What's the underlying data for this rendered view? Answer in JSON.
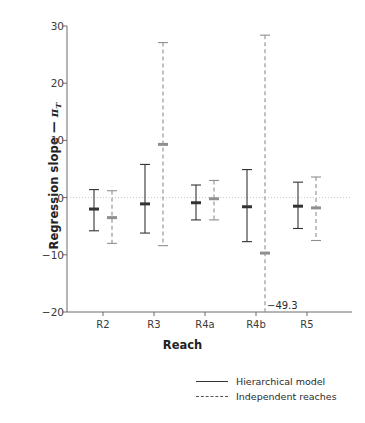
{
  "chart_data": {
    "type": "scatter",
    "title": "",
    "xlabel": "Reach",
    "ylabel_parts": {
      "prefix": "Regression slope",
      "dash": "—",
      "symbol": "π",
      "subscript": "T"
    },
    "ylabel": "Regression slope — πT",
    "categories": [
      "R2",
      "R3",
      "R4a",
      "R4b",
      "R5"
    ],
    "ylim": [
      -20,
      30
    ],
    "yticks": [
      -20,
      -10,
      0,
      10,
      20,
      30
    ],
    "ytick_labels": [
      "−20",
      "−10",
      "0",
      "10",
      "20",
      "30"
    ],
    "grid": false,
    "zero_line": 0,
    "legend_position": "below-right",
    "series": [
      {
        "name": "Hierarchical model",
        "style": "solid",
        "color": "#333333",
        "offset": -9,
        "points": [
          {
            "category": "R2",
            "value": -2.0,
            "low": -5.8,
            "high": 1.4
          },
          {
            "category": "R3",
            "value": -1.1,
            "low": -6.2,
            "high": 5.8
          },
          {
            "category": "R4a",
            "value": -0.9,
            "low": -3.9,
            "high": 2.2
          },
          {
            "category": "R4b",
            "value": -1.6,
            "low": -7.7,
            "high": 4.9
          },
          {
            "category": "R5",
            "value": -1.5,
            "low": -5.4,
            "high": 2.7
          }
        ]
      },
      {
        "name": "Independent reaches",
        "style": "dashed",
        "color": "#8f8f8f",
        "offset": 9,
        "points": [
          {
            "category": "R2",
            "value": -3.5,
            "low": -8.0,
            "high": 1.2
          },
          {
            "category": "R3",
            "value": 9.3,
            "low": -8.4,
            "high": 27.1
          },
          {
            "category": "R4a",
            "value": -0.2,
            "low": -3.9,
            "high": 3.0
          },
          {
            "category": "R4b",
            "value": -9.7,
            "low": -49.3,
            "high": 28.4,
            "low_clipped": true,
            "low_label": "−49.3"
          },
          {
            "category": "R5",
            "value": -1.8,
            "low": -7.5,
            "high": 3.6
          }
        ]
      }
    ],
    "annotations": [
      {
        "text": "−49.3",
        "x_category": "R4b",
        "y": -20,
        "note": "clipped lower bound of Independent reaches at R4b"
      }
    ]
  },
  "axes": {
    "y_tick_labels": [
      "30",
      "20",
      "10",
      "0",
      "−10",
      "−20"
    ],
    "x_tick_labels": [
      "R2",
      "R3",
      "R4a",
      "R4b",
      "R5"
    ],
    "x_title": "Reach"
  },
  "legend": {
    "items": [
      {
        "label": "Hierarchical model",
        "style": "solid"
      },
      {
        "label": "Independent reaches",
        "style": "dashed"
      }
    ]
  },
  "colors": {
    "hierarchical": "#333333",
    "independent": "#8f8f8f",
    "axis": "#6b6b6b",
    "zero_line": "#c9c9c9",
    "text": "#2a2a2a",
    "background": "#ffffff"
  }
}
